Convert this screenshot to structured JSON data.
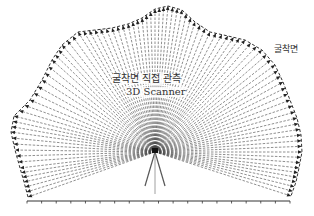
{
  "labels": {
    "main": "굴착면 직접 관측",
    "sub": "3D Scanner",
    "surface": "굴착면"
  },
  "scanner": {
    "x": 155,
    "y": 152
  },
  "ground": {
    "y": 201,
    "x1": 27,
    "x2": 290,
    "tick_count": 18
  },
  "outline": [
    [
      28,
      197
    ],
    [
      24,
      182
    ],
    [
      20,
      168
    ],
    [
      15,
      150
    ],
    [
      11,
      132
    ],
    [
      14,
      116
    ],
    [
      30,
      100
    ],
    [
      42,
      80
    ],
    [
      52,
      60
    ],
    [
      62,
      45
    ],
    [
      78,
      32
    ],
    [
      95,
      30
    ],
    [
      112,
      28
    ],
    [
      128,
      24
    ],
    [
      142,
      18
    ],
    [
      155,
      9
    ],
    [
      168,
      6
    ],
    [
      182,
      10
    ],
    [
      195,
      22
    ],
    [
      210,
      32
    ],
    [
      228,
      36
    ],
    [
      245,
      40
    ],
    [
      262,
      50
    ],
    [
      275,
      65
    ],
    [
      283,
      82
    ],
    [
      290,
      100
    ],
    [
      297,
      118
    ],
    [
      301,
      135
    ],
    [
      302,
      152
    ],
    [
      299,
      168
    ],
    [
      296,
      182
    ],
    [
      291,
      196
    ]
  ],
  "colors": {
    "line": "#333333",
    "arrow": "#222222"
  }
}
